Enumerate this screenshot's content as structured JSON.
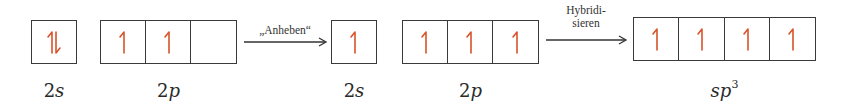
{
  "electron_color": "#d9532c",
  "states": [
    {
      "id": "ground",
      "orbitals": [
        {
          "label_num": "2",
          "label_var": "s",
          "sup": "",
          "cells": [
            "pair"
          ]
        },
        {
          "label_num": "2",
          "label_var": "p",
          "sup": "",
          "cells": [
            "up",
            "up",
            "empty"
          ]
        }
      ]
    },
    {
      "id": "excited",
      "orbitals": [
        {
          "label_num": "2",
          "label_var": "s",
          "sup": "",
          "cells": [
            "up"
          ]
        },
        {
          "label_num": "2",
          "label_var": "p",
          "sup": "",
          "cells": [
            "up",
            "up",
            "up"
          ]
        }
      ]
    },
    {
      "id": "hybridized",
      "orbitals": [
        {
          "label_num": "",
          "label_var": "sp",
          "sup": "3",
          "cells": [
            "up",
            "up",
            "up",
            "up"
          ]
        }
      ]
    }
  ],
  "arrows": [
    {
      "lines": [
        "„Anheben“"
      ]
    },
    {
      "lines": [
        "Hybridi-",
        "sieren"
      ]
    }
  ],
  "labels": {
    "g_2s_num": "2",
    "g_2s_var": "s",
    "g_2p_num": "2",
    "g_2p_var": "p",
    "e_2s_num": "2",
    "e_2s_var": "s",
    "e_2p_num": "2",
    "e_2p_var": "p",
    "h_var": "sp",
    "h_sup": "3"
  },
  "arrow_labels": {
    "a1_line1": "„Anheben“",
    "a2_line1": "Hybridi-",
    "a2_line2": "sieren"
  }
}
